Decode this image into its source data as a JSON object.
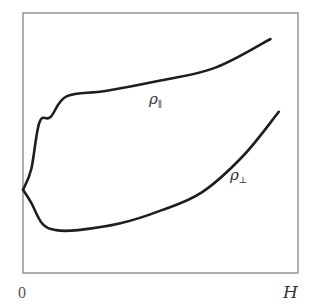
{
  "chart_data": {
    "type": "line",
    "title": "",
    "xlabel": "H",
    "ylabel": "",
    "x_tick_labels": [
      "0"
    ],
    "xlim": [
      0,
      1
    ],
    "ylim": [
      0,
      1
    ],
    "grid": false,
    "legend": "none (inline curve labels)",
    "series": [
      {
        "name": "ρ∥",
        "label": "ρ∥",
        "x": [
          0.0,
          0.03,
          0.06,
          0.1,
          0.16,
          0.3,
          0.5,
          0.7,
          0.9
        ],
        "y": [
          0.32,
          0.4,
          0.58,
          0.6,
          0.68,
          0.7,
          0.74,
          0.79,
          0.9
        ]
      },
      {
        "name": "ρ⊥",
        "label": "ρ⊥",
        "x": [
          0.0,
          0.03,
          0.07,
          0.12,
          0.2,
          0.35,
          0.5,
          0.65,
          0.8,
          0.93
        ],
        "y": [
          0.32,
          0.27,
          0.19,
          0.165,
          0.165,
          0.19,
          0.24,
          0.31,
          0.45,
          0.62
        ]
      }
    ],
    "annotations": [
      {
        "text": "ρ∥",
        "near_series": "ρ∥"
      },
      {
        "text": "ρ⊥",
        "near_series": "ρ⊥"
      }
    ]
  },
  "labels": {
    "rho_parallel_base": "ρ",
    "rho_parallel_sub": "∥",
    "rho_perp_base": "ρ",
    "rho_perp_sub": "⊥",
    "x_origin": "0",
    "x_axis": "H"
  }
}
